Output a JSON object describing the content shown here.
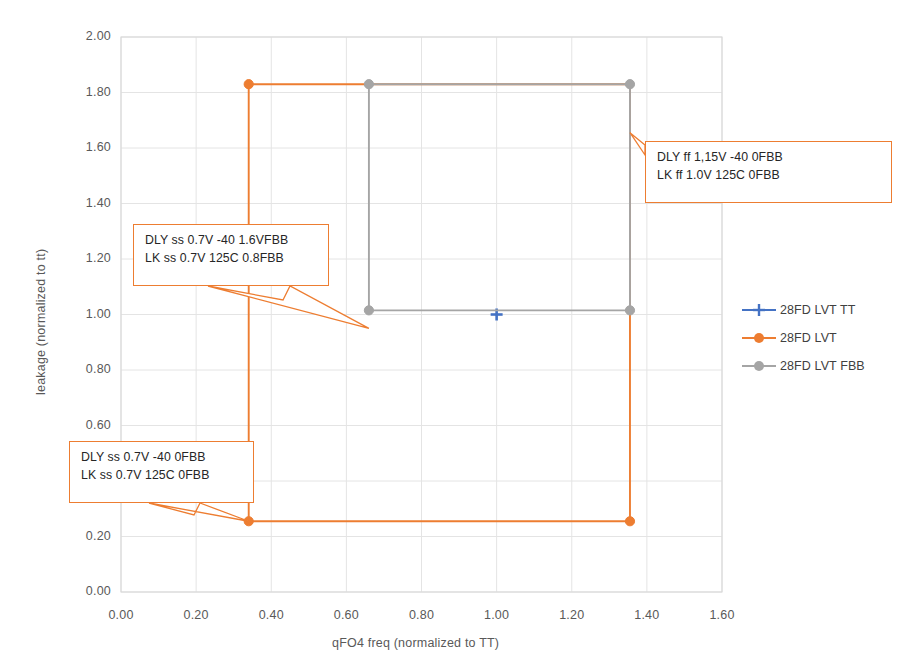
{
  "chart_data": {
    "type": "line",
    "title": "",
    "xlabel": "qFO4 freq (normalized to TT)",
    "ylabel": "leakage (normalized to tt)",
    "xlim": [
      0.0,
      1.6
    ],
    "ylim": [
      0.0,
      2.0
    ],
    "xticks": [
      "0.00",
      "0.20",
      "0.40",
      "0.60",
      "0.80",
      "1.00",
      "1.20",
      "1.40",
      "1.60"
    ],
    "yticks": [
      "0.00",
      "0.20",
      "0.40",
      "0.60",
      "0.80",
      "1.00",
      "1.20",
      "1.40",
      "1.60",
      "1.80",
      "2.00"
    ],
    "xtick_values": [
      0.0,
      0.2,
      0.4,
      0.6,
      0.8,
      1.0,
      1.2,
      1.4,
      1.6
    ],
    "ytick_values": [
      0.0,
      0.2,
      0.4,
      0.6,
      0.8,
      1.0,
      1.2,
      1.4,
      1.6,
      1.8,
      2.0
    ],
    "grid": true,
    "legend_position": "right",
    "series": [
      {
        "name": "28FD LVT TT",
        "color": "#4472C4",
        "marker": "plus",
        "points": [
          [
            1.0,
            1.0
          ]
        ]
      },
      {
        "name": "28FD LVT",
        "color": "#ED7D31",
        "marker": "circle",
        "closed": true,
        "points": [
          [
            0.34,
            1.83
          ],
          [
            1.355,
            1.83
          ],
          [
            1.355,
            0.255
          ],
          [
            0.34,
            0.255
          ]
        ],
        "labelled_points": [
          [
            0.34,
            1.83
          ],
          [
            1.355,
            0.255
          ],
          [
            0.34,
            0.255
          ]
        ]
      },
      {
        "name": "28FD LVT FBB",
        "color": "#A5A5A5",
        "marker": "circle",
        "closed": true,
        "points": [
          [
            0.66,
            1.83
          ],
          [
            1.355,
            1.83
          ],
          [
            1.355,
            1.015
          ],
          [
            0.66,
            1.015
          ]
        ],
        "labelled_points": [
          [
            0.66,
            1.83
          ],
          [
            1.355,
            1.83
          ],
          [
            1.355,
            1.015
          ],
          [
            0.66,
            1.015
          ]
        ]
      }
    ],
    "annotations": [
      {
        "id": "annotation-ss-fbb",
        "line1": "DLY ss 0.7V -40 1.6VFBB",
        "line2": "LK ss 0.7V 125C 0.8FBB",
        "target": [
          0.66,
          1.015
        ]
      },
      {
        "id": "annotation-ff",
        "line1": "DLY ff 1,15V -40 0FBB",
        "line2": "LK ff 1.0V 125C 0FBB",
        "target": [
          1.355,
          1.66
        ]
      },
      {
        "id": "annotation-ss",
        "line1": "DLY ss 0.7V -40 0FBB",
        "line2": "LK ss 0.7V 125C 0FBB",
        "target": [
          0.34,
          0.255
        ]
      }
    ]
  },
  "legend": {
    "items": [
      {
        "label": "28FD LVT TT",
        "color": "#4472C4"
      },
      {
        "label": "28FD LVT",
        "color": "#ED7D31"
      },
      {
        "label": "28FD LVT FBB",
        "color": "#A5A5A5"
      }
    ]
  },
  "colors": {
    "tt": "#4472C4",
    "lvt": "#ED7D31",
    "fbb": "#A5A5A5",
    "grid": "#E4E4E4",
    "axis": "#D9D9D9",
    "text": "#595959"
  }
}
